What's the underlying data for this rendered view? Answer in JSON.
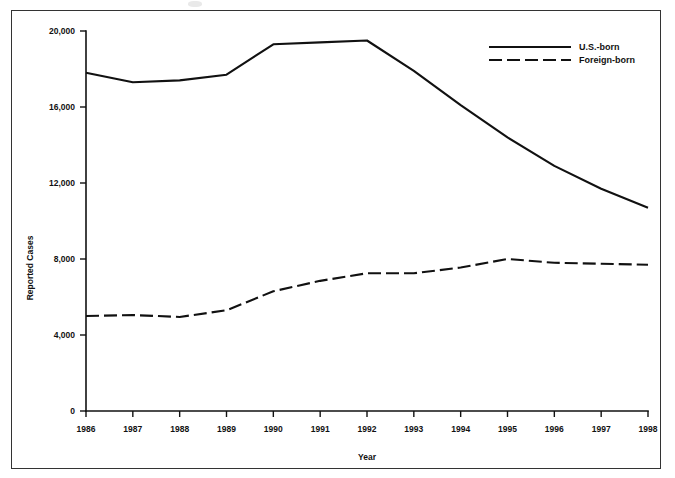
{
  "figure": {
    "name": "tuberculosis-cases-by-origin-line-chart",
    "background_color": "#ffffff",
    "line_color": "#111111",
    "frame_color": "#333333"
  },
  "chart_data": {
    "type": "line",
    "title": "",
    "xlabel": "Year",
    "ylabel": "Reported Cases",
    "categories": [
      "1986",
      "1987",
      "1988",
      "1989",
      "1990",
      "1991",
      "1992",
      "1993",
      "1994",
      "1995",
      "1996",
      "1997",
      "1998"
    ],
    "x": [
      1986,
      1987,
      1988,
      1989,
      1990,
      1991,
      1992,
      1993,
      1994,
      1995,
      1996,
      1997,
      1998
    ],
    "xlim": [
      1986,
      1998
    ],
    "ylim": [
      0,
      20000
    ],
    "yticks": [
      0,
      4000,
      8000,
      12000,
      16000,
      20000
    ],
    "ytick_labels": [
      "0",
      "4,000",
      "8,000",
      "12,000",
      "16,000",
      "20,000"
    ],
    "xticks": [
      1986,
      1987,
      1988,
      1989,
      1990,
      1991,
      1992,
      1993,
      1994,
      1995,
      1996,
      1997,
      1998
    ],
    "grid": false,
    "legend_position": "top-right",
    "series": [
      {
        "name": "U.S.-born",
        "style": "solid",
        "values": [
          17800,
          17300,
          17400,
          17700,
          19300,
          19400,
          19500,
          17900,
          16100,
          14400,
          12900,
          11700,
          10700
        ]
      },
      {
        "name": "Foreign-born",
        "style": "dashed",
        "values": [
          5000,
          5050,
          4950,
          5300,
          6300,
          6850,
          7250,
          7250,
          7550,
          8000,
          7800,
          7750,
          7700
        ]
      }
    ]
  },
  "legend": {
    "entries": [
      {
        "label": "U.S.-born",
        "style": "solid"
      },
      {
        "label": "Foreign-born",
        "style": "dashed"
      }
    ]
  },
  "axes": {
    "y_axis_title": "Reported Cases",
    "x_axis_title": "Year"
  }
}
